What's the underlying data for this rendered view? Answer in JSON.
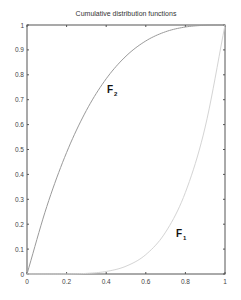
{
  "chart_data": {
    "type": "line",
    "title": "Cumulative distribution functions",
    "xlabel": "",
    "ylabel": "",
    "xlim": [
      0,
      1
    ],
    "ylim": [
      0,
      1
    ],
    "grid": false,
    "legend": null,
    "x_ticks": [
      "0",
      "0.2",
      "0.4",
      "0.6",
      "0.8",
      "1"
    ],
    "y_ticks": [
      "0",
      "0.1",
      "0.2",
      "0.3",
      "0.4",
      "0.5",
      "0.6",
      "0.7",
      "0.8",
      "0.9",
      "1"
    ],
    "x": [
      0,
      0.1,
      0.2,
      0.3,
      0.4,
      0.5,
      0.6,
      0.7,
      0.8,
      0.9,
      1.0
    ],
    "series": [
      {
        "name": "F1",
        "label_main": "F",
        "label_sub": "1",
        "color": "#d4d4d4",
        "values": [
          0,
          1e-05,
          0.0003,
          0.0024,
          0.0102,
          0.0313,
          0.0778,
          0.1681,
          0.3277,
          0.5905,
          1.0
        ]
      },
      {
        "name": "F2",
        "label_main": "F",
        "label_sub": "2",
        "color": "#9a9a9a",
        "values": [
          0,
          0.271,
          0.488,
          0.657,
          0.784,
          0.875,
          0.936,
          0.973,
          0.992,
          0.999,
          1.0
        ]
      }
    ],
    "annotations": [
      {
        "text": "F2",
        "x": 0.41,
        "y": 0.75
      },
      {
        "text": "F1",
        "x": 0.75,
        "y": 0.17
      }
    ]
  }
}
